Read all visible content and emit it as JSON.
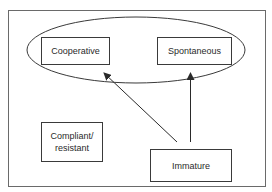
{
  "diagram": {
    "colors": {
      "stroke": "#3a3a3a",
      "frame": "#6a6a6a",
      "text": "#2a2a2a",
      "background": "#ffffff"
    },
    "group": {
      "shape": "ellipse",
      "members": [
        "cooperative",
        "spontaneous"
      ]
    },
    "nodes": {
      "cooperative": {
        "label": "Cooperative"
      },
      "spontaneous": {
        "label": "Spontaneous"
      },
      "compliant_resistant": {
        "line1": "Compliant/",
        "line2": "resistant"
      },
      "immature": {
        "label": "Immature"
      }
    },
    "edges": [
      {
        "from": "Immature",
        "to": "Cooperative"
      },
      {
        "from": "Immature",
        "to": "Spontaneous"
      }
    ]
  }
}
